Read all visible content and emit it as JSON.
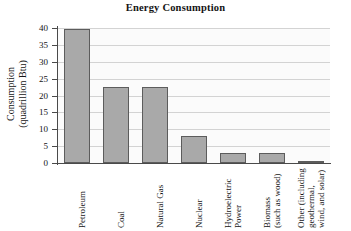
{
  "chart_data": {
    "type": "bar",
    "title": "Energy Consumption",
    "xlabel": "",
    "ylabel": "Consumption\n(quadrillion Btu)",
    "ylim": [
      0,
      40
    ],
    "yticks": [
      0,
      5,
      10,
      15,
      20,
      25,
      30,
      35,
      40
    ],
    "ytick_labels": [
      "0",
      "5",
      "10",
      "15",
      "20",
      "25",
      "30",
      "35",
      "40"
    ],
    "grid": "horizontal",
    "legend": "none",
    "bar_color": "#a9a9a9",
    "bar_edge_color": "#5c5c5c",
    "plot_background": "#fbfbfb",
    "gridline_color": "#d3d3d3",
    "axis_color": "#4a4a4a",
    "categories": [
      "Petroleum",
      "Coal",
      "Natural Gas",
      "Nuclear",
      "Hydroelectric\nPower",
      "Biomass\n(such as wood)",
      "Other (including\ngeothermal,\nwind, and solar)"
    ],
    "values": [
      39.7,
      22.5,
      22.5,
      8.0,
      2.9,
      2.9,
      0.6
    ]
  }
}
